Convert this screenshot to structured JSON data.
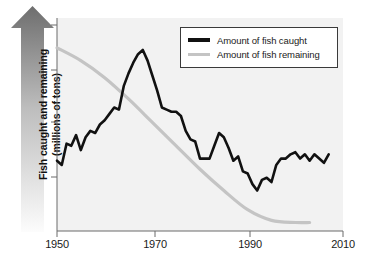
{
  "chart_data": {
    "type": "line",
    "title": "",
    "xlabel": "",
    "ylabel": "Fish caught and remaining (millions of tons)",
    "ylabel_line1": "Fish caught and remaining",
    "ylabel_line2": "(millions of tons)",
    "xlim": [
      1950,
      2010
    ],
    "ylim": [
      0,
      100
    ],
    "grid": false,
    "y_axis_style": "arrow",
    "y_tick_labels": [],
    "y_ticks_unlabeled": 4,
    "legend_position": "top-right",
    "xticks": [
      1950,
      1970,
      1990,
      2010
    ],
    "xtick_labels": [
      "1950",
      "1970",
      "1990",
      "2010"
    ],
    "series": [
      {
        "name": "Amount of fish caught",
        "color": "#111111",
        "x": [
          1950,
          1951,
          1952,
          1953,
          1954,
          1955,
          1956,
          1957,
          1958,
          1959,
          1960,
          1961,
          1962,
          1963,
          1964,
          1965,
          1966,
          1967,
          1968,
          1969,
          1970,
          1971,
          1972,
          1973,
          1974,
          1975,
          1976,
          1977,
          1978,
          1979,
          1980,
          1981,
          1982,
          1983,
          1984,
          1985,
          1986,
          1987,
          1988,
          1989,
          1990,
          1991,
          1992,
          1993,
          1994,
          1995,
          1996,
          1997,
          1998,
          1999,
          2000,
          2001,
          2002,
          2003,
          2004,
          2005,
          2006,
          2007
        ],
        "values": [
          33,
          31,
          41,
          40,
          45,
          38,
          44,
          47,
          46,
          50,
          52,
          55,
          58,
          57,
          68,
          74,
          79,
          83,
          85,
          80,
          73,
          66,
          58,
          57,
          56,
          56,
          54,
          47,
          43,
          42,
          34,
          34,
          34,
          40,
          46,
          44,
          39,
          33,
          35,
          28,
          27,
          22,
          19,
          24,
          25,
          23,
          31,
          34,
          34,
          36,
          37,
          34,
          36,
          33,
          36,
          34,
          32,
          36
        ]
      },
      {
        "name": "Amount of fish remaining",
        "color": "#c4c4c4",
        "x": [
          1950,
          1955,
          1960,
          1965,
          1970,
          1975,
          1980,
          1985,
          1990,
          1995,
          2000,
          2003
        ],
        "values": [
          86,
          80,
          72,
          62,
          51,
          40,
          29,
          19,
          10,
          5,
          4,
          4
        ]
      }
    ]
  },
  "legend": {
    "items": [
      {
        "label": "Amount of fish caught",
        "color": "#111111"
      },
      {
        "label": "Amount of fish remaining",
        "color": "#c4c4c4"
      }
    ]
  },
  "colors": {
    "caught": "#111111",
    "remaining": "#c4c4c4",
    "panel_bg": "#f2f2f2",
    "axis": "#6b6b6b",
    "text": "#1a1a1a",
    "arrow_dark": "#6e6e6e",
    "arrow_light": "#fbfbfb"
  }
}
